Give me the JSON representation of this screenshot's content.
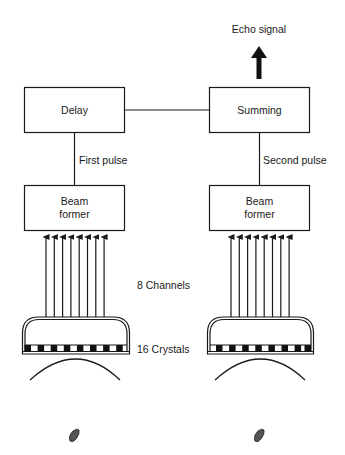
{
  "diagram": {
    "output_label": "Echo signal",
    "connector_labels": {
      "first": "First pulse",
      "second": "Second pulse"
    },
    "center_labels": {
      "channels": "8 Channels",
      "crystals": "16 Crystals"
    },
    "blocks": {
      "delay": "Delay",
      "summing": "Summing",
      "beam_former_line1": "Beam",
      "beam_former_line2": "former"
    },
    "channel_count": 8,
    "crystal_count": 16,
    "colors": {
      "stroke": "#1a1a1a",
      "crystal_dark": "#111111",
      "blob": "#555555"
    }
  }
}
